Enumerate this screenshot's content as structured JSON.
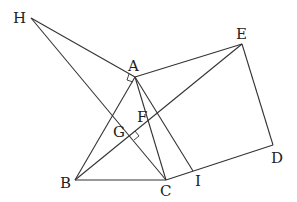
{
  "diagram": {
    "points": {
      "H": {
        "x": 31,
        "y": 18,
        "lx": 13,
        "ly": 23,
        "label": "H"
      },
      "A": {
        "x": 135,
        "y": 77,
        "lx": 128,
        "ly": 71,
        "label": "A"
      },
      "E": {
        "x": 242,
        "y": 44,
        "lx": 236,
        "ly": 39,
        "label": "E"
      },
      "D": {
        "x": 273,
        "y": 145,
        "lx": 271,
        "ly": 163,
        "label": "D"
      },
      "B": {
        "x": 75,
        "y": 180,
        "lx": 60,
        "ly": 188,
        "label": "B"
      },
      "C": {
        "x": 166,
        "y": 180,
        "lx": 160,
        "ly": 196,
        "label": "C"
      },
      "I": {
        "x": 193,
        "y": 171,
        "lx": 195,
        "ly": 186,
        "label": "I"
      },
      "F": {
        "x": 150,
        "y": 118,
        "lx": 137,
        "ly": 122,
        "label": "F"
      },
      "G": {
        "x": 130,
        "y": 135,
        "lx": 113,
        "ly": 137,
        "label": "G"
      }
    },
    "segments": [
      [
        "H",
        "A"
      ],
      [
        "H",
        "C"
      ],
      [
        "A",
        "E"
      ],
      [
        "E",
        "D"
      ],
      [
        "D",
        "C"
      ],
      [
        "A",
        "B"
      ],
      [
        "A",
        "C"
      ],
      [
        "B",
        "C"
      ],
      [
        "B",
        "E"
      ],
      [
        "A",
        "I"
      ]
    ],
    "right_angle_marks": [
      "A",
      "G"
    ]
  }
}
